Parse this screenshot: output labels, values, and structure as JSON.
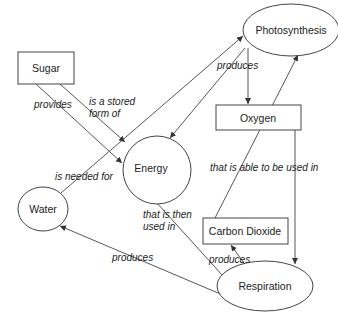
{
  "diagram": {
    "type": "concept-map",
    "nodes": {
      "sugar": {
        "label": "Sugar",
        "shape": "rectangle"
      },
      "photosynthesis": {
        "label": "Photosynthesis",
        "shape": "ellipse"
      },
      "oxygen": {
        "label": "Oxygen",
        "shape": "rectangle"
      },
      "energy": {
        "label": "Energy",
        "shape": "ellipse"
      },
      "water": {
        "label": "Water",
        "shape": "ellipse"
      },
      "carbon_dioxide": {
        "label": "Carbon Dioxide",
        "shape": "rectangle"
      },
      "respiration": {
        "label": "Respiration",
        "shape": "ellipse"
      }
    },
    "edges": {
      "sugar_provides_energy": {
        "from": "Sugar",
        "to": "Energy",
        "label": "provides"
      },
      "sugar_stored_energy": {
        "from": "Sugar",
        "to": "Energy",
        "label_line1": "is a stored",
        "label_line2": "form of"
      },
      "water_needed_photosynthesis": {
        "from": "Water",
        "to": "Photosynthesis",
        "label": "is needed for"
      },
      "photosynthesis_produces": {
        "from": "Photosynthesis",
        "to": [
          "Oxygen",
          "Energy"
        ],
        "label": "produces"
      },
      "co2_used_photosynthesis": {
        "from": "Carbon Dioxide",
        "to": "Photosynthesis",
        "label": "that is able to be used in"
      },
      "oxygen_to_respiration": {
        "from": "Oxygen",
        "to": "Respiration",
        "label": ""
      },
      "energy_used_respiration": {
        "from": "Energy",
        "to": "Respiration",
        "label_line1": "that is then",
        "label_line2": "used in"
      },
      "respiration_produces_co2": {
        "from": "Respiration",
        "to": "Carbon Dioxide",
        "label": "produces"
      },
      "respiration_produces_water": {
        "from": "Respiration",
        "to": "Water",
        "label": "produces"
      }
    }
  }
}
